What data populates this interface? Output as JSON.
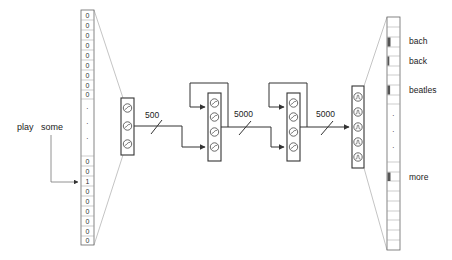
{
  "input": {
    "query_words": [
      "play",
      "some"
    ],
    "top_cells": [
      "0",
      "0",
      "0",
      "0",
      "0",
      "0",
      "0",
      "0",
      "0"
    ],
    "ellipsis": [
      "·",
      "·",
      "·"
    ],
    "bottom_cells": [
      "0",
      "0",
      "1",
      "0",
      "0",
      "0",
      "0",
      "0",
      "0"
    ]
  },
  "layers": [
    {
      "id": "embedding",
      "units_shown": 3,
      "glyph": "sigmoid"
    },
    {
      "id": "hidden-1",
      "units_shown": 4,
      "glyph": "sigmoid",
      "recurrent": true
    },
    {
      "id": "hidden-2",
      "units_shown": 4,
      "glyph": "sigmoid",
      "recurrent": true
    },
    {
      "id": "output",
      "units_shown": 5,
      "glyph": "softmax"
    }
  ],
  "connections": [
    {
      "from": "embedding",
      "to": "hidden-1",
      "size_label": "500"
    },
    {
      "from": "hidden-1",
      "to": "hidden-2",
      "size_label": "5000"
    },
    {
      "from": "hidden-2",
      "to": "output",
      "size_label": "5000"
    }
  ],
  "output": {
    "words": [
      "bach",
      "back",
      "beatles",
      "more"
    ],
    "ellipsis": [
      "·",
      "·",
      "·"
    ]
  },
  "colors": {
    "stroke": "#333333",
    "thin": "#777777",
    "marker": "#555555"
  }
}
